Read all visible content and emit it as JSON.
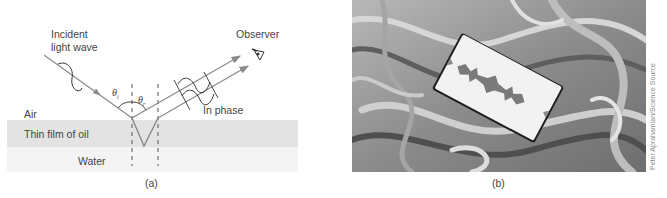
{
  "figure": {
    "panel_a": {
      "caption": "(a)",
      "labels": {
        "incident_line1": "Incident",
        "incident_line2": "light wave",
        "observer": "Observer",
        "theta_i": "θi",
        "theta_r": "θr",
        "in_phase": "In phase",
        "air": "Air",
        "oil": "Thin film of oil",
        "water": "Water"
      },
      "colors": {
        "oil_band": "#e3e3e3",
        "water_band": "#f3f3f3",
        "ray": "#8a8a8a",
        "wave": "#333333"
      }
    },
    "panel_b": {
      "caption": "(b)",
      "credit": "Peter Aprahamian/Science Source",
      "description": "Razor blade resting on a swirling oil film showing thin-film interference patterns"
    }
  }
}
